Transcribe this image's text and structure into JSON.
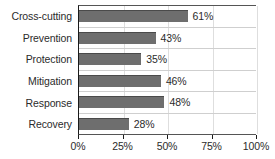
{
  "chart_data": {
    "type": "bar",
    "orientation": "horizontal",
    "title": "",
    "subtitle": "",
    "xlabel": "",
    "ylabel": "",
    "categories": [
      "Cross-cutting",
      "Prevention",
      "Protection",
      "Mitigation",
      "Response",
      "Recovery"
    ],
    "values": [
      61,
      43,
      35,
      46,
      48,
      28
    ],
    "value_labels": [
      "61%",
      "43%",
      "35%",
      "46%",
      "48%",
      "28%"
    ],
    "xlim": [
      0,
      100
    ],
    "xticks": [
      0,
      25,
      50,
      75,
      100
    ],
    "xtick_labels": [
      "0%",
      "25%",
      "50%",
      "75%",
      "100%"
    ],
    "grid": "vertical",
    "legend": "none",
    "bar_color": "#6e6e6e",
    "bar_edge_color": "#4a4a4a",
    "axis_color": "#1a1a1a",
    "grid_color": "#dedede",
    "text_color": "#2b2b2b"
  }
}
